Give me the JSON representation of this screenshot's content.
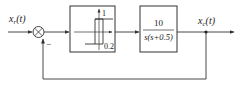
{
  "diagram": {
    "type": "control-system-block-diagram",
    "input_label": {
      "base": "x",
      "sub": "r",
      "arg": "(t)"
    },
    "output_label": {
      "base": "x",
      "sub": "c",
      "arg": "(t)"
    },
    "summing_junction": {
      "feedback_sign": "−"
    },
    "nonlinear_block": {
      "type": "relay-with-hysteresis",
      "amplitude_label": "1",
      "hysteresis_label": "0.2"
    },
    "plant_block": {
      "numerator": "10",
      "denominator": "s(s+0.5)"
    },
    "feedback": "unity negative feedback",
    "colors": {
      "line": "#333333",
      "background": "#ffffff"
    }
  }
}
